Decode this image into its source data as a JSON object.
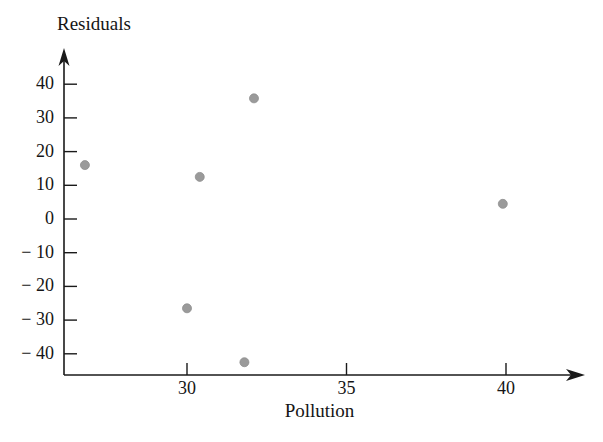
{
  "chart_data": {
    "type": "scatter",
    "title": "",
    "xlabel": "Pollution",
    "ylabel": "Residuals",
    "xlim": [
      26.0,
      41.3
    ],
    "ylim": [
      -45.5,
      46.0
    ],
    "grid": false,
    "legend": null,
    "xticks": [
      30,
      35,
      40
    ],
    "xtick_labels": [
      "30",
      "35",
      "40"
    ],
    "yticks": [
      40,
      30,
      20,
      10,
      0,
      -10,
      -20,
      -30,
      -40
    ],
    "ytick_labels": [
      "40",
      "30",
      "20",
      "10",
      "0",
      "− 10",
      "− 20",
      "− 30",
      "− 40"
    ],
    "marker": {
      "shape": "circle",
      "color": "#9a9a9a",
      "edge_color": "#8e8e8e",
      "size_px": 9
    },
    "points": [
      {
        "x": 26.8,
        "y": 16.0
      },
      {
        "x": 30.0,
        "y": -26.5
      },
      {
        "x": 30.4,
        "y": 12.5
      },
      {
        "x": 31.8,
        "y": -42.5
      },
      {
        "x": 32.1,
        "y": 35.8
      },
      {
        "x": 39.9,
        "y": 4.5
      }
    ],
    "axis_style": {
      "color": "#1a1a1a",
      "arrow_heads": [
        "x-right",
        "y-top"
      ],
      "line_width": 1.6
    }
  },
  "figure": {
    "background": "#ffffff",
    "width": 603,
    "height": 442
  }
}
